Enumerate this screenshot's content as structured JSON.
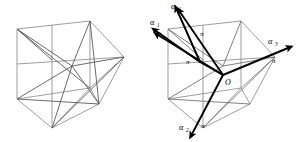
{
  "figure": {
    "background_color": "#ffffff",
    "edge_color": "#8d8d8d",
    "vector_color": "#000000",
    "panels": [
      {
        "name": "left-panel",
        "description": "Plain cube with internal diagonals, unlabeled"
      },
      {
        "name": "right-panel",
        "description": "Cube with four labeled normal vectors from center O and pi plane labels"
      }
    ],
    "labels": {
      "alpha1": "α",
      "alpha1_sub": "1",
      "alpha2": "α",
      "alpha2_sub": "2",
      "alpha3": "α",
      "alpha3_sub": "3",
      "alpha4": "α",
      "alpha4_sub": "4",
      "pi1": "π",
      "pi2": "π",
      "pi3": "π",
      "pi4": "π",
      "origin": "O"
    }
  }
}
